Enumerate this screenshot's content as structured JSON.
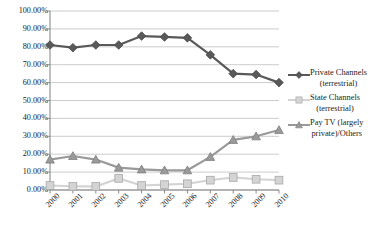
{
  "chart_data": {
    "type": "line",
    "title": "",
    "xlabel": "",
    "ylabel": "",
    "x": [
      "2000",
      "2001",
      "2002",
      "2003",
      "2004",
      "2005",
      "2006",
      "2007",
      "2008",
      "2009",
      "2010"
    ],
    "categories": [
      "2000",
      "2001",
      "2002",
      "2003",
      "2004",
      "2005",
      "2006",
      "2007",
      "2008",
      "2009",
      "2010"
    ],
    "ylim": [
      0,
      100
    ],
    "ytick_values": [
      0,
      10,
      20,
      30,
      40,
      50,
      60,
      70,
      80,
      90,
      100
    ],
    "ytick_labels": [
      "0.00%",
      "10.00%",
      "20.00%",
      "30.00%",
      "40.00%",
      "50.00%",
      "60.00%",
      "70.00%",
      "80.00%",
      "90.00%",
      "100.00%"
    ],
    "grid": true,
    "legend_position": "right",
    "series": [
      {
        "name": "Private Channels (terrestrial)",
        "legend_line1": "Private Channels",
        "legend_line2": "(terrestrial)",
        "color": "#595959",
        "marker": "diamond",
        "values": [
          81.0,
          79.5,
          81.0,
          81.0,
          86.0,
          85.5,
          85.0,
          75.5,
          65.0,
          64.5,
          60.0
        ]
      },
      {
        "name": "State Channels (terrestrial)",
        "legend_line1": "State Channels",
        "legend_line2": "(terrestrial)",
        "color": "#d4d4d4",
        "marker": "square",
        "values": [
          2.5,
          2.0,
          2.0,
          6.5,
          2.5,
          3.0,
          3.5,
          5.5,
          7.0,
          6.0,
          5.5
        ]
      },
      {
        "name": "Pay TV (largely private)/Others",
        "legend_line1": "Pay TV (largely",
        "legend_line2": "private)/Others",
        "color": "#9a9a9a",
        "marker": "triangle",
        "values": [
          17.0,
          19.0,
          17.0,
          12.5,
          11.5,
          11.0,
          11.0,
          18.5,
          28.0,
          30.0,
          33.5
        ]
      }
    ]
  },
  "colors": {
    "grid": "#bfbfbf",
    "axis": "#808080",
    "text": "#1c1c1c",
    "background": "#ffffff"
  }
}
